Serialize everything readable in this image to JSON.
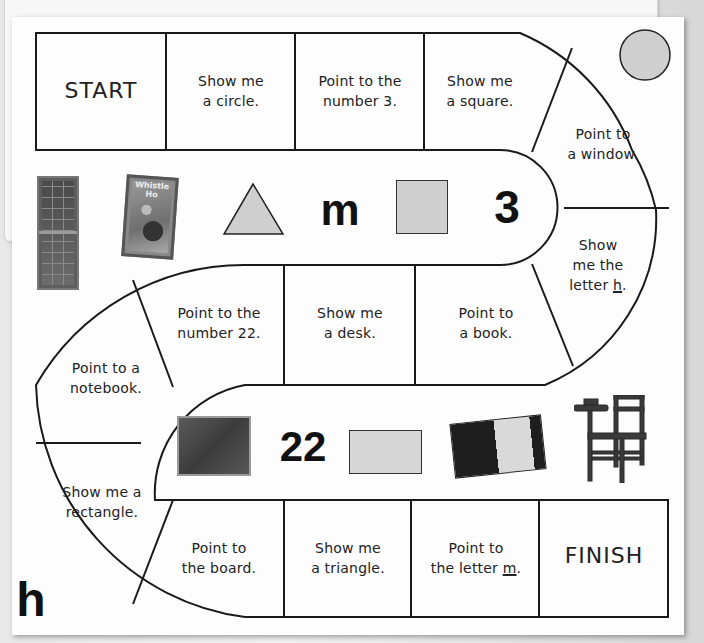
{
  "board": {
    "title": "Classroom board game",
    "spaces": [
      {
        "id": "start",
        "label": "START"
      },
      {
        "id": "space-1",
        "line1": "Show me",
        "line2": "a circle."
      },
      {
        "id": "space-2",
        "line1": "Point to the",
        "line2": "number 3."
      },
      {
        "id": "space-3",
        "line1": "Show me",
        "line2": "a square."
      },
      {
        "id": "space-4",
        "line1": "Point to",
        "line2": "a window."
      },
      {
        "id": "space-5",
        "line1": "Show",
        "line2": "me the",
        "line3_prefix": "letter ",
        "line3_underlined": "h",
        "line3_suffix": "."
      },
      {
        "id": "space-6",
        "line1": "Point to",
        "line2": "a book."
      },
      {
        "id": "space-7",
        "line1": "Show me",
        "line2": "a desk."
      },
      {
        "id": "space-8",
        "line1": "Point to the",
        "line2": "number 22."
      },
      {
        "id": "space-9",
        "line1": "Point to a",
        "line2": "notebook."
      },
      {
        "id": "space-10",
        "line1": "Show me a",
        "line2": "rectangle."
      },
      {
        "id": "space-11",
        "line1": "Point to",
        "line2": "the board."
      },
      {
        "id": "space-12",
        "line1": "Show me",
        "line2": "a triangle."
      },
      {
        "id": "space-13",
        "line1": "Point to",
        "line2_prefix": "the letter ",
        "line2_underlined": "m",
        "line2_suffix": "."
      },
      {
        "id": "finish",
        "label": "FINISH"
      }
    ]
  },
  "pictures": {
    "upper_row": {
      "window": "window-photo",
      "book": "book-photo",
      "book_cover_text": "Whistle Ho",
      "triangle": "triangle-shape",
      "letter": "m",
      "square": "square-shape",
      "number": "3"
    },
    "lower_row": {
      "board": "chalkboard-photo",
      "number": "22",
      "rectangle": "rectangle-shape",
      "notebook": "notebook-photo",
      "desk": "desk-photo"
    },
    "circle": "circle-shape",
    "corner_letter": "h"
  },
  "colors": {
    "shape_fill": "#cfcfcf",
    "line": "#1a1a1a",
    "paper": "#fdfdfd",
    "background": "#c9c9c9"
  }
}
